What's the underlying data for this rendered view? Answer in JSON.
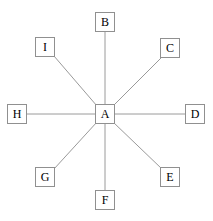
{
  "diagram": {
    "type": "star-network-graph",
    "canvas": {
      "width": 213,
      "height": 221
    },
    "style": {
      "background_color": "#ffffff",
      "node_fill_color": "#ffffff",
      "node_border_color": "#909090",
      "node_label_color": "#000000",
      "edge_color": "#9a9a9a",
      "edge_width": 1
    },
    "nodes": [
      {
        "id": "A",
        "label": "A",
        "role": "hub",
        "position": "center",
        "cx": 105,
        "cy": 114,
        "w": 20,
        "h": 20
      },
      {
        "id": "B",
        "label": "B",
        "role": "spoke",
        "position": "top",
        "cx": 105,
        "cy": 22,
        "w": 20,
        "h": 20
      },
      {
        "id": "C",
        "label": "C",
        "role": "spoke",
        "position": "upper-right",
        "cx": 170,
        "cy": 48,
        "w": 20,
        "h": 20
      },
      {
        "id": "D",
        "label": "D",
        "role": "spoke",
        "position": "right",
        "cx": 195,
        "cy": 114,
        "w": 20,
        "h": 20
      },
      {
        "id": "E",
        "label": "E",
        "role": "spoke",
        "position": "lower-right",
        "cx": 170,
        "cy": 177,
        "w": 20,
        "h": 20
      },
      {
        "id": "F",
        "label": "F",
        "role": "spoke",
        "position": "bottom",
        "cx": 105,
        "cy": 200,
        "w": 20,
        "h": 20
      },
      {
        "id": "G",
        "label": "G",
        "role": "spoke",
        "position": "lower-left",
        "cx": 45,
        "cy": 177,
        "w": 20,
        "h": 20
      },
      {
        "id": "H",
        "label": "H",
        "role": "spoke",
        "position": "left",
        "cx": 17,
        "cy": 114,
        "w": 20,
        "h": 20
      },
      {
        "id": "I",
        "label": "I",
        "role": "spoke",
        "position": "upper-left",
        "cx": 45,
        "cy": 47,
        "w": 20,
        "h": 20
      }
    ],
    "edges": [
      {
        "id": "edge-a-b",
        "from": "A",
        "to": "B",
        "x1": 105,
        "y1": 104,
        "x2": 105,
        "y2": 32
      },
      {
        "id": "edge-a-c",
        "from": "A",
        "to": "C",
        "x1": 113,
        "y1": 106,
        "x2": 162,
        "y2": 57
      },
      {
        "id": "edge-a-d",
        "from": "A",
        "to": "D",
        "x1": 115,
        "y1": 114,
        "x2": 185,
        "y2": 114
      },
      {
        "id": "edge-a-e",
        "from": "A",
        "to": "E",
        "x1": 113,
        "y1": 122,
        "x2": 162,
        "y2": 169
      },
      {
        "id": "edge-a-f",
        "from": "A",
        "to": "F",
        "x1": 105,
        "y1": 124,
        "x2": 105,
        "y2": 190
      },
      {
        "id": "edge-a-g",
        "from": "A",
        "to": "G",
        "x1": 97,
        "y1": 122,
        "x2": 54,
        "y2": 169
      },
      {
        "id": "edge-a-h",
        "from": "A",
        "to": "H",
        "x1": 95,
        "y1": 114,
        "x2": 27,
        "y2": 114
      },
      {
        "id": "edge-a-i",
        "from": "A",
        "to": "I",
        "x1": 97,
        "y1": 106,
        "x2": 54,
        "y2": 56
      }
    ]
  }
}
